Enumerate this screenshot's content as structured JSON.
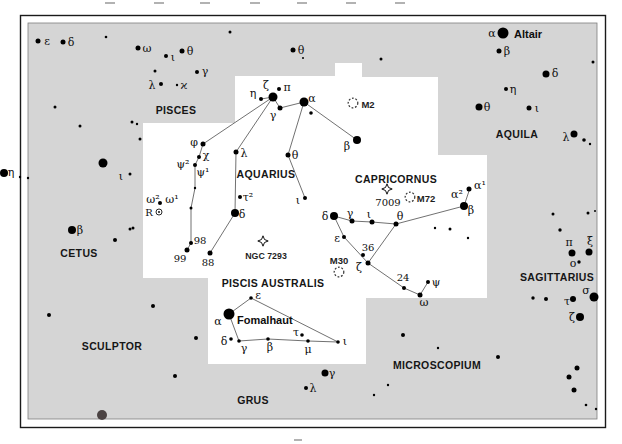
{
  "colors": {
    "page_bg": "#ffffff",
    "chart_bg": "#d5d5d5",
    "highlight_region": "#ffffff",
    "frame": "#1a1a1a",
    "inner_border": "#7e7e7e",
    "star": "#000000",
    "dark_star": "#4b4343",
    "line": "#4d4d4d",
    "dso": "#333333",
    "tick": "#b2b2b2"
  },
  "frame": {
    "outer": {
      "x": 20.5,
      "y": 15.5,
      "w": 585,
      "h": 412
    },
    "gray": {
      "x": 28,
      "y": 23,
      "w": 569,
      "h": 396
    }
  },
  "ticks": {
    "top_y": 2,
    "top_x": [
      110,
      159,
      205,
      255,
      302,
      351,
      400
    ],
    "bottom": {
      "x": 298,
      "y": 439
    }
  },
  "white_region": [
    [
      235,
      76
    ],
    [
      335,
      76
    ],
    [
      335,
      63
    ],
    [
      362,
      63
    ],
    [
      362,
      77
    ],
    [
      438,
      77
    ],
    [
      438,
      155
    ],
    [
      487,
      155
    ],
    [
      487,
      298
    ],
    [
      366,
      298
    ],
    [
      366,
      364
    ],
    [
      208,
      364
    ],
    [
      208,
      278
    ],
    [
      143,
      278
    ],
    [
      143,
      123
    ],
    [
      235,
      123
    ]
  ],
  "constellation_labels": [
    {
      "t": "PISCES",
      "x": 176,
      "y": 110
    },
    {
      "t": "AQUARIUS",
      "x": 266,
      "y": 174
    },
    {
      "t": "CAPRICORNUS",
      "x": 396,
      "y": 179
    },
    {
      "t": "AQUILA",
      "x": 517,
      "y": 134
    },
    {
      "t": "CETUS",
      "x": 79,
      "y": 253
    },
    {
      "t": "SCULPTOR",
      "x": 112,
      "y": 346
    },
    {
      "t": "PISCIS AUSTRALIS",
      "x": 273,
      "y": 283
    },
    {
      "t": "GRUS",
      "x": 253,
      "y": 400
    },
    {
      "t": "MICROSCOPIUM",
      "x": 437,
      "y": 365
    },
    {
      "t": "SAGITTARIUS",
      "x": 557,
      "y": 277
    }
  ],
  "star_name_labels": [
    {
      "t": "Altair",
      "x": 514,
      "y": 34,
      "a": "start"
    },
    {
      "t": "Fomalhaut",
      "x": 237,
      "y": 320,
      "a": "start"
    }
  ],
  "greek_labels": [
    {
      "t": "ε",
      "x": 47,
      "y": 41
    },
    {
      "t": "δ",
      "x": 71,
      "y": 42
    },
    {
      "t": "ω",
      "x": 147,
      "y": 48
    },
    {
      "t": "ι",
      "x": 173,
      "y": 57
    },
    {
      "t": "θ",
      "x": 190,
      "y": 51
    },
    {
      "t": "γ",
      "x": 205,
      "y": 71
    },
    {
      "t": "λ",
      "x": 152,
      "y": 85
    },
    {
      "t": "ϰ",
      "x": 184,
      "y": 85
    },
    {
      "t": "θ",
      "x": 301,
      "y": 50
    },
    {
      "t": "η",
      "x": 11,
      "y": 172
    },
    {
      "t": "β",
      "x": 80,
      "y": 230
    },
    {
      "t": "ι",
      "x": 121,
      "y": 176
    },
    {
      "t": "α",
      "x": 492,
      "y": 33
    },
    {
      "t": "β",
      "x": 507,
      "y": 51
    },
    {
      "t": "δ",
      "x": 555,
      "y": 73
    },
    {
      "t": "η",
      "x": 513,
      "y": 89
    },
    {
      "t": "θ",
      "x": 487,
      "y": 107
    },
    {
      "t": "ι",
      "x": 537,
      "y": 108
    },
    {
      "t": "λ",
      "x": 566,
      "y": 137
    },
    {
      "t": "π",
      "x": 569,
      "y": 242
    },
    {
      "t": "ξ",
      "x": 590,
      "y": 241
    },
    {
      "t": "ο",
      "x": 573,
      "y": 263
    },
    {
      "t": "σ",
      "x": 586,
      "y": 290
    },
    {
      "t": "τ",
      "x": 567,
      "y": 301
    },
    {
      "t": "ζ",
      "x": 572,
      "y": 317
    },
    {
      "t": "γ",
      "x": 332,
      "y": 373
    },
    {
      "t": "λ",
      "x": 313,
      "y": 388
    },
    {
      "t": "η",
      "x": 253,
      "y": 93
    },
    {
      "t": "ζ",
      "x": 266,
      "y": 85
    },
    {
      "t": "π",
      "x": 287,
      "y": 87
    },
    {
      "t": "γ",
      "x": 273,
      "y": 115
    },
    {
      "t": "α",
      "x": 312,
      "y": 98
    },
    {
      "t": "β",
      "x": 347,
      "y": 146
    },
    {
      "t": "φ",
      "x": 194,
      "y": 142
    },
    {
      "t": "χ",
      "x": 206,
      "y": 155
    },
    {
      "t": "ψ²",
      "x": 183,
      "y": 164
    },
    {
      "t": "ψ¹",
      "x": 203,
      "y": 172
    },
    {
      "t": "λ",
      "x": 244,
      "y": 153
    },
    {
      "t": "θ",
      "x": 295,
      "y": 155
    },
    {
      "t": "ι",
      "x": 298,
      "y": 200
    },
    {
      "t": "τ²",
      "x": 248,
      "y": 197
    },
    {
      "t": "δ",
      "x": 242,
      "y": 214
    },
    {
      "t": "ω²",
      "x": 153,
      "y": 199
    },
    {
      "t": "ω¹",
      "x": 172,
      "y": 199
    },
    {
      "t": "α²",
      "x": 457,
      "y": 194
    },
    {
      "t": "α¹",
      "x": 480,
      "y": 185
    },
    {
      "t": "β",
      "x": 471,
      "y": 210
    },
    {
      "t": "δ",
      "x": 325,
      "y": 216
    },
    {
      "t": "γ",
      "x": 350,
      "y": 213
    },
    {
      "t": "ι",
      "x": 369,
      "y": 214
    },
    {
      "t": "θ",
      "x": 400,
      "y": 216
    },
    {
      "t": "ε",
      "x": 337,
      "y": 238
    },
    {
      "t": "ζ",
      "x": 359,
      "y": 267
    },
    {
      "t": "ψ",
      "x": 436,
      "y": 282
    },
    {
      "t": "ω",
      "x": 424,
      "y": 302
    },
    {
      "t": "ε",
      "x": 258,
      "y": 295
    },
    {
      "t": "α",
      "x": 218,
      "y": 321
    },
    {
      "t": "δ",
      "x": 224,
      "y": 341
    },
    {
      "t": "γ",
      "x": 244,
      "y": 348
    },
    {
      "t": "β",
      "x": 270,
      "y": 347
    },
    {
      "t": "τ",
      "x": 296,
      "y": 332
    },
    {
      "t": "μ",
      "x": 308,
      "y": 349
    },
    {
      "t": "ι",
      "x": 345,
      "y": 341
    }
  ],
  "number_labels": [
    {
      "t": "98",
      "x": 200,
      "y": 240
    },
    {
      "t": "99",
      "x": 180,
      "y": 258
    },
    {
      "t": "88",
      "x": 208,
      "y": 262
    },
    {
      "t": "36",
      "x": 368,
      "y": 247
    },
    {
      "t": "24",
      "x": 403,
      "y": 277
    },
    {
      "t": "7009",
      "x": 388,
      "y": 202
    },
    {
      "t": "R",
      "x": 149,
      "y": 212
    }
  ],
  "messier_labels": [
    {
      "t": "M2",
      "x": 368,
      "y": 104
    },
    {
      "t": "M72",
      "x": 426,
      "y": 198
    },
    {
      "t": "M30",
      "x": 339,
      "y": 260
    }
  ],
  "ngc_labels": [
    {
      "t": "NGC 7293",
      "x": 266,
      "y": 256
    }
  ],
  "stars": [
    [
      38,
      41,
      2.5
    ],
    [
      63,
      42,
      2.5
    ],
    [
      106,
      37,
      1.3
    ],
    [
      138,
      48,
      2.5
    ],
    [
      166,
      56,
      2
    ],
    [
      182,
      51,
      2.5
    ],
    [
      155,
      71,
      1.5
    ],
    [
      197,
      72,
      2
    ],
    [
      161,
      84,
      2
    ],
    [
      177,
      85,
      1.2
    ],
    [
      55,
      107,
      1.5
    ],
    [
      80,
      126,
      1.5
    ],
    [
      132,
      122,
      1.5
    ],
    [
      137,
      124,
      1.2
    ],
    [
      140,
      139,
      1.5
    ],
    [
      103,
      163,
      4.5
    ],
    [
      230,
      32,
      1.5
    ],
    [
      293,
      50,
      2.5
    ],
    [
      303,
      58,
      1
    ],
    [
      381,
      59,
      1.5
    ],
    [
      4,
      173,
      4
    ],
    [
      20,
      177,
      1.2
    ],
    [
      28,
      178,
      1.2
    ],
    [
      130,
      174,
      1.5
    ],
    [
      133,
      228,
      1.5
    ],
    [
      72,
      230,
      4
    ],
    [
      115,
      240,
      2
    ],
    [
      130,
      229,
      1.5
    ],
    [
      49,
      315,
      2
    ],
    [
      153,
      306,
      2
    ],
    [
      196,
      338,
      2
    ],
    [
      175,
      376,
      2
    ],
    [
      503,
      33,
      5.5
    ],
    [
      499,
      51,
      2.5
    ],
    [
      546,
      74,
      3.5
    ],
    [
      506,
      89,
      2
    ],
    [
      479,
      107,
      3.5
    ],
    [
      529,
      108,
      2.5
    ],
    [
      574,
      134,
      3.5
    ],
    [
      584,
      140,
      1.8
    ],
    [
      590,
      144,
      1.2
    ],
    [
      593,
      62,
      1.5
    ],
    [
      588,
      213,
      1.5
    ],
    [
      595,
      211,
      1
    ],
    [
      553,
      214,
      1.5
    ],
    [
      560,
      230,
      1.7
    ],
    [
      572,
      253,
      3.5
    ],
    [
      589,
      252,
      3.5
    ],
    [
      579,
      262,
      1.7
    ],
    [
      594,
      297,
      4.5
    ],
    [
      573,
      299,
      3
    ],
    [
      533,
      298,
      1.7
    ],
    [
      546,
      299,
      2
    ],
    [
      580,
      317,
      4
    ],
    [
      577,
      368,
      2.5
    ],
    [
      569,
      377,
      2.5
    ],
    [
      574,
      390,
      2.5
    ],
    [
      586,
      405,
      1.3
    ],
    [
      596,
      409,
      1.2
    ],
    [
      403,
      335,
      2
    ],
    [
      438,
      348,
      1.2
    ],
    [
      498,
      357,
      2
    ],
    [
      388,
      385,
      1.2
    ],
    [
      374,
      395,
      1.2
    ],
    [
      325,
      373,
      3.5
    ],
    [
      306,
      388,
      2
    ],
    [
      261,
      99,
      2
    ],
    [
      273,
      97,
      4.5
    ],
    [
      279,
      89,
      2
    ],
    [
      280,
      108,
      2.5
    ],
    [
      304,
      102,
      4.5
    ],
    [
      311,
      113,
      1.8
    ],
    [
      357,
      140,
      4
    ],
    [
      203,
      144,
      2.5
    ],
    [
      199,
      157,
      2
    ],
    [
      195,
      165,
      2
    ],
    [
      195,
      188,
      1.2
    ],
    [
      191,
      208,
      1.5
    ],
    [
      160,
      203,
      2
    ],
    [
      240,
      197,
      2
    ],
    [
      235,
      213,
      4
    ],
    [
      236,
      152,
      2.5
    ],
    [
      288,
      155,
      2.5
    ],
    [
      305,
      198,
      2
    ],
    [
      191,
      243,
      2
    ],
    [
      187,
      250,
      2.5
    ],
    [
      210,
      253,
      2.5
    ],
    [
      469,
      189,
      2.5
    ],
    [
      464,
      206,
      4
    ],
    [
      334,
      216,
      4
    ],
    [
      352,
      221,
      2.5
    ],
    [
      372,
      222,
      2.5
    ],
    [
      396,
      224,
      2.5
    ],
    [
      344,
      237,
      2
    ],
    [
      363,
      255,
      2
    ],
    [
      368,
      263,
      2.5
    ],
    [
      404,
      288,
      2
    ],
    [
      428,
      282,
      2
    ],
    [
      420,
      295,
      2.5
    ],
    [
      435,
      228,
      1.2
    ],
    [
      450,
      229,
      1.5
    ],
    [
      468,
      238,
      1.2
    ],
    [
      251,
      298,
      1.8
    ],
    [
      229,
      314,
      5.5
    ],
    [
      231,
      339,
      1.8
    ],
    [
      239,
      341,
      1.8
    ],
    [
      268,
      339,
      1.8
    ],
    [
      302,
      335,
      1.8
    ],
    [
      308,
      341,
      1.8
    ],
    [
      338,
      342,
      1.8
    ]
  ],
  "dark_stars": [
    [
      102,
      415,
      5
    ]
  ],
  "lines": [
    [
      261,
      99,
      273,
      97
    ],
    [
      273,
      97,
      280,
      108
    ],
    [
      280,
      108,
      304,
      102
    ],
    [
      304,
      102,
      357,
      140
    ],
    [
      304,
      102,
      288,
      155
    ],
    [
      288,
      155,
      305,
      198
    ],
    [
      273,
      97,
      203,
      144
    ],
    [
      273,
      97,
      236,
      152
    ],
    [
      236,
      152,
      235,
      213
    ],
    [
      235,
      213,
      210,
      253
    ],
    [
      203,
      144,
      199,
      157
    ],
    [
      199,
      157,
      195,
      165
    ],
    [
      195,
      165,
      195,
      188
    ],
    [
      195,
      188,
      191,
      208
    ],
    [
      191,
      208,
      191,
      243
    ],
    [
      191,
      243,
      187,
      250
    ],
    [
      334,
      216,
      352,
      221
    ],
    [
      352,
      221,
      372,
      222
    ],
    [
      372,
      222,
      396,
      224
    ],
    [
      396,
      224,
      464,
      206
    ],
    [
      464,
      206,
      469,
      191
    ],
    [
      334,
      216,
      344,
      237
    ],
    [
      344,
      237,
      368,
      263
    ],
    [
      396,
      224,
      368,
      263
    ],
    [
      368,
      263,
      404,
      288
    ],
    [
      404,
      288,
      420,
      295
    ],
    [
      420,
      295,
      428,
      282
    ],
    [
      251,
      298,
      229,
      314
    ],
    [
      229,
      314,
      239,
      341
    ],
    [
      239,
      341,
      268,
      339
    ],
    [
      268,
      339,
      308,
      341
    ],
    [
      308,
      341,
      338,
      342
    ],
    [
      338,
      342,
      251,
      298
    ]
  ],
  "deep_sky_objects": [
    {
      "kind": "globular",
      "name": "M2",
      "x": 353,
      "y": 103
    },
    {
      "kind": "globular",
      "name": "M72",
      "x": 410,
      "y": 197
    },
    {
      "kind": "globular",
      "name": "M30",
      "x": 339,
      "y": 272
    },
    {
      "kind": "planetary",
      "name": "NGC 7293",
      "x": 263,
      "y": 241
    },
    {
      "kind": "planetary",
      "name": "7009",
      "x": 387,
      "y": 189
    }
  ],
  "variable_stars": [
    {
      "name": "R",
      "x": 159,
      "y": 212,
      "r": 3
    }
  ]
}
